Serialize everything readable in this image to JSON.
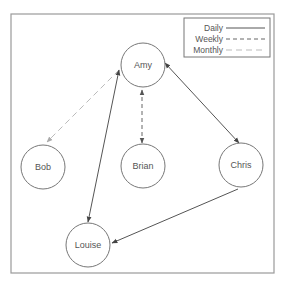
{
  "diagram": {
    "type": "social-network-graph",
    "frame": {
      "x": 11,
      "y": 14,
      "width": 263,
      "height": 259,
      "color": "#9a9a9a"
    },
    "node_style": {
      "radius": 22,
      "stroke": "#777777"
    },
    "nodes": [
      {
        "id": "amy",
        "label": "Amy",
        "cx": 143,
        "cy": 65
      },
      {
        "id": "bob",
        "label": "Bob",
        "cx": 43,
        "cy": 167
      },
      {
        "id": "brian",
        "label": "Brian",
        "cx": 143,
        "cy": 166
      },
      {
        "id": "chris",
        "label": "Chris",
        "cx": 241,
        "cy": 165
      },
      {
        "id": "louise",
        "label": "Louise",
        "cx": 88,
        "cy": 245
      }
    ],
    "edges": [
      {
        "from": "amy",
        "to": "bob",
        "frequency": "Monthly",
        "arrow_start": false,
        "arrow_end": true,
        "x1": 119,
        "y1": 70,
        "x2": 47,
        "y2": 142
      },
      {
        "from": "amy",
        "to": "louise",
        "frequency": "Daily",
        "arrow_start": true,
        "arrow_end": true,
        "x1": 119,
        "y1": 70,
        "x2": 88,
        "y2": 222
      },
      {
        "from": "amy",
        "to": "brian",
        "frequency": "Weekly",
        "arrow_start": true,
        "arrow_end": true,
        "x1": 142,
        "y1": 90,
        "x2": 142,
        "y2": 143
      },
      {
        "from": "amy",
        "to": "chris",
        "frequency": "Daily",
        "arrow_start": true,
        "arrow_end": true,
        "x1": 165,
        "y1": 63,
        "x2": 239,
        "y2": 143
      },
      {
        "from": "chris",
        "to": "louise",
        "frequency": "Daily",
        "arrow_start": false,
        "arrow_end": true,
        "x1": 238,
        "y1": 189,
        "x2": 112,
        "y2": 243
      }
    ],
    "legend": {
      "x": 184,
      "y": 18,
      "width": 86,
      "height": 39,
      "entries": [
        {
          "label": "Daily",
          "style": "solid",
          "color": "#555555"
        },
        {
          "label": "Weekly",
          "style": "dashed",
          "color": "#666666"
        },
        {
          "label": "Monthly",
          "style": "long-dashed",
          "color": "#bbbbbb"
        }
      ]
    },
    "styles": {
      "Daily": {
        "color": "#555555",
        "dash": ""
      },
      "Weekly": {
        "color": "#666666",
        "dash": "4,3"
      },
      "Monthly": {
        "color": "#bbbbbb",
        "dash": "6,4"
      }
    }
  }
}
